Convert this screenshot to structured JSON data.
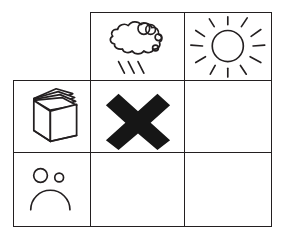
{
  "figure": {
    "ink_color": "#231f20",
    "background_color": "#ffffff",
    "grid": {
      "rows": 3,
      "columns": 3,
      "header_row_label": "weather condition",
      "header_column_label": "activity / mood",
      "corner_cell_is_blank": true
    }
  },
  "cells": [
    {
      "id": "r1c1",
      "row": 1,
      "column": 1,
      "bordered": false,
      "icon": "blank",
      "icon_label": "empty corner cell",
      "content": ""
    },
    {
      "id": "r1c2",
      "row": 1,
      "column": 2,
      "bordered": true,
      "icon": "rain-cloud-icon",
      "icon_label": "rain cloud with three raindrop streaks",
      "content": ""
    },
    {
      "id": "r1c3",
      "row": 1,
      "column": 3,
      "bordered": true,
      "icon": "sun-icon",
      "icon_label": "sun with eleven radiating rays",
      "content": ""
    },
    {
      "id": "r2c1",
      "row": 2,
      "column": 1,
      "bordered": true,
      "icon": "open-book-icon",
      "icon_label": "open book standing upright with fanned pages",
      "content": ""
    },
    {
      "id": "r2c2",
      "row": 2,
      "column": 2,
      "bordered": true,
      "icon": "cross-mark-icon",
      "icon_label": "bold black X cross mark",
      "content": ""
    },
    {
      "id": "r2c3",
      "row": 2,
      "column": 3,
      "bordered": true,
      "icon": "blank",
      "icon_label": "empty answer cell",
      "content": ""
    },
    {
      "id": "r3c1",
      "row": 3,
      "column": 1,
      "bordered": true,
      "icon": "sad-face-icon",
      "icon_label": "sad face with two eyes and a downturned mouth",
      "content": ""
    },
    {
      "id": "r3c2",
      "row": 3,
      "column": 2,
      "bordered": true,
      "icon": "blank",
      "icon_label": "empty answer cell",
      "content": ""
    },
    {
      "id": "r3c3",
      "row": 3,
      "column": 3,
      "bordered": true,
      "icon": "blank",
      "icon_label": "empty answer cell",
      "content": ""
    }
  ]
}
